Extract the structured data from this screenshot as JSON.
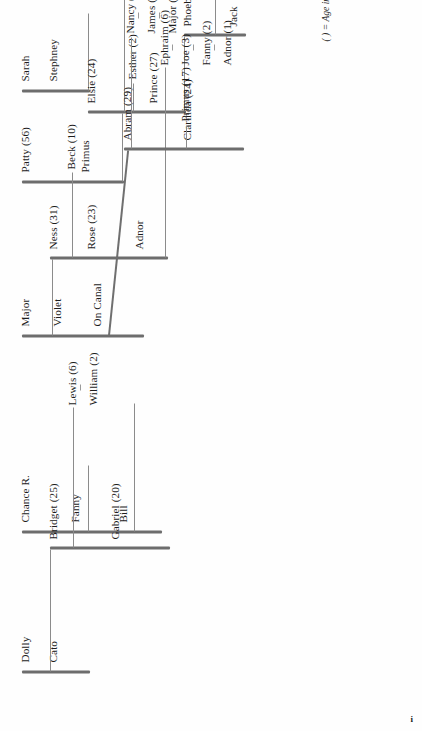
{
  "document": {
    "type": "genealogical-chart",
    "caption": "( ) = Age in 1830",
    "folio": "i",
    "orientation": "rotated-90-counterclockwise"
  },
  "generations": [
    {
      "index": 0,
      "name": "founders",
      "spines": [
        {
          "id": "g0-sarah-stephney",
          "labels": [
            "Sarah",
            "Stephney"
          ]
        },
        {
          "id": "g0-patty-primus",
          "labels": [
            "Patty (56)",
            "Primus"
          ]
        },
        {
          "id": "g0-major-violet-oncanal",
          "labels": [
            "Major",
            "Violet",
            "On Canal"
          ]
        },
        {
          "id": "g0-chance-fanny-bill",
          "labels": [
            "Chance R.",
            "Fanny",
            "Bill"
          ]
        },
        {
          "id": "g0-dolly-cato",
          "labels": [
            "Dolly",
            "Cato"
          ]
        }
      ]
    },
    {
      "index": 1,
      "name": "children",
      "spines": [
        {
          "id": "g1-elsie-prince",
          "labels": [
            "Elsie (24)",
            "Prince (27)"
          ]
        },
        {
          "id": "g1-ness-rose-adnor",
          "labels": [
            "Ness (31)",
            "Rose (23)",
            "Adnor"
          ]
        },
        {
          "id": "g1-gabriel-bridget",
          "labels": [
            "Gabriel (20)",
            "Bridget (25)"
          ]
        }
      ],
      "leaves": [
        {
          "id": "g1-esther",
          "label": "Esther (2)"
        }
      ]
    },
    {
      "index": 2,
      "name": "grandchildren",
      "spines": [
        {
          "id": "g2-phoebe-jack",
          "labels": [
            "Phoebe (21)",
            "Jack"
          ]
        },
        {
          "id": "g2-clarinda-abram",
          "labels": [
            "Clarinda (24)",
            "Abram (29)"
          ]
        }
      ],
      "leaves": [
        {
          "id": "g2-beck",
          "label": "Beck (10)"
        }
      ]
    },
    {
      "index": 3,
      "name": "great-grandchildren",
      "leaves": [
        {
          "id": "g3-sarah",
          "label": "Sarah (6)"
        },
        {
          "id": "g3-primus",
          "label": "Primus (17)"
        }
      ],
      "groups": [
        {
          "id": "g3-nancy-james-major",
          "members": [
            "Nancy (6)",
            "James (4)",
            "Major (2)"
          ]
        },
        {
          "id": "g3-ephraim-joe-fanny-adnor",
          "members": [
            "Ephraim (6)",
            "Joe (3)",
            "Fanny (2)",
            "Adnor (1)"
          ]
        },
        {
          "id": "g3-lewis-william",
          "members": [
            "Lewis (6)",
            "William (2)"
          ]
        }
      ]
    }
  ],
  "people": {
    "sarah": "Sarah",
    "stephney": "Stephney",
    "patty": "Patty (56)",
    "primus_elder": "Primus",
    "major_elder": "Major",
    "violet": "Violet",
    "on_canal": "On Canal",
    "chance_r": "Chance R.",
    "fanny_elder": "Fanny",
    "bill": "Bill",
    "dolly": "Dolly",
    "cato": "Cato",
    "elsie": "Elsie (24)",
    "prince": "Prince (27)",
    "esther": "Esther (2)",
    "ness": "Ness (31)",
    "rose": "Rose (23)",
    "adnor_elder": "Adnor",
    "gabriel": "Gabriel (20)",
    "bridget": "Bridget (25)",
    "phoebe": "Phoebe (21)",
    "jack": "Jack",
    "clarinda": "Clarinda (24)",
    "abram": "Abram (29)",
    "beck": "Beck (10)",
    "sarah_young": "Sarah (6)",
    "primus_young": "Primus (17)",
    "nancy": "Nancy (6)",
    "james": "James (4)",
    "major_young": "Major (2)",
    "ephraim": "Ephraim (6)",
    "joe": "Joe (3)",
    "fanny_young": "Fanny (2)",
    "adnor_young": "Adnor (1)",
    "lewis": "Lewis (6)",
    "william": "William (2)"
  },
  "style": {
    "spine_color": "#6d6d6d",
    "connector_color": "#8b8b8b",
    "text_color": "#1c1c1c",
    "paper": "#fefefe"
  }
}
